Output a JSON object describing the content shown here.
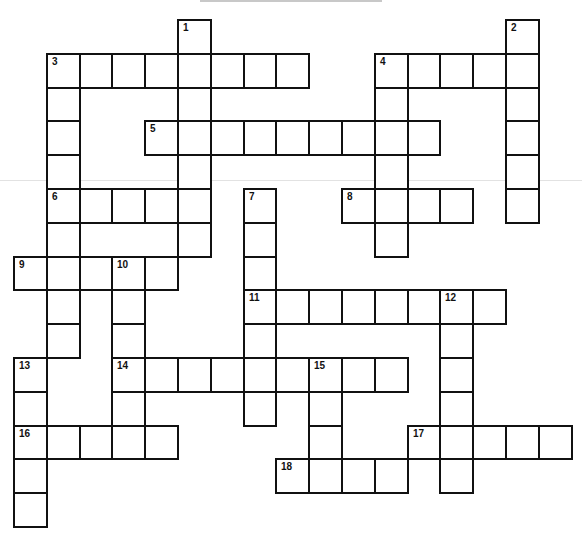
{
  "puzzle": {
    "type": "crossword",
    "grid_origin": {
      "x": 13,
      "y": 19
    },
    "cell_size": {
      "w": 32.8,
      "h": 33.8
    },
    "colors": {
      "border": "#111111",
      "cell_bg": "#ffffff",
      "rule": "#c8c8c8"
    },
    "entries": [
      {
        "number": 1,
        "direction": "down",
        "row": 0,
        "col": 5,
        "length": 7
      },
      {
        "number": 2,
        "direction": "down",
        "row": 0,
        "col": 15,
        "length": 6
      },
      {
        "number": 3,
        "direction": "across",
        "row": 1,
        "col": 1,
        "length": 8
      },
      {
        "number": 3,
        "direction": "down",
        "row": 1,
        "col": 1,
        "length": 9
      },
      {
        "number": 4,
        "direction": "across",
        "row": 1,
        "col": 11,
        "length": 5
      },
      {
        "number": 4,
        "direction": "down",
        "row": 1,
        "col": 11,
        "length": 6
      },
      {
        "number": 5,
        "direction": "across",
        "row": 3,
        "col": 4,
        "length": 9
      },
      {
        "number": 6,
        "direction": "across",
        "row": 5,
        "col": 1,
        "length": 5
      },
      {
        "number": 7,
        "direction": "down",
        "row": 5,
        "col": 7,
        "length": 7
      },
      {
        "number": 8,
        "direction": "across",
        "row": 5,
        "col": 10,
        "length": 4
      },
      {
        "number": 9,
        "direction": "across",
        "row": 7,
        "col": 0,
        "length": 5
      },
      {
        "number": 10,
        "direction": "down",
        "row": 7,
        "col": 3,
        "length": 6
      },
      {
        "number": 11,
        "direction": "across",
        "row": 8,
        "col": 7,
        "length": 8
      },
      {
        "number": 12,
        "direction": "down",
        "row": 8,
        "col": 13,
        "length": 6
      },
      {
        "number": 13,
        "direction": "down",
        "row": 10,
        "col": 0,
        "length": 5
      },
      {
        "number": 14,
        "direction": "across",
        "row": 10,
        "col": 3,
        "length": 9
      },
      {
        "number": 15,
        "direction": "down",
        "row": 10,
        "col": 9,
        "length": 4
      },
      {
        "number": 16,
        "direction": "across",
        "row": 12,
        "col": 0,
        "length": 5
      },
      {
        "number": 17,
        "direction": "across",
        "row": 12,
        "col": 12,
        "length": 5
      },
      {
        "number": 18,
        "direction": "across",
        "row": 13,
        "col": 8,
        "length": 4
      }
    ],
    "filled_letters": {}
  }
}
